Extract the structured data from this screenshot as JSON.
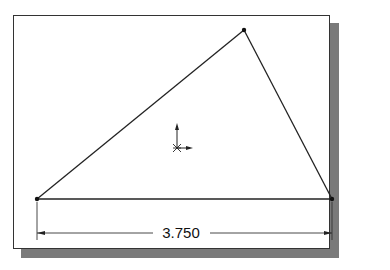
{
  "sketch": {
    "dimension": {
      "label": "3.750",
      "orientation": "horizontal"
    },
    "vertices": [
      {
        "name": "bottom-left",
        "x": 37,
        "y": 199
      },
      {
        "name": "apex",
        "x": 244,
        "y": 30
      },
      {
        "name": "bottom-right",
        "x": 332,
        "y": 199
      }
    ],
    "origin": {
      "x": 177,
      "y": 148
    },
    "colors": {
      "line": "#222222",
      "shadow": "#7a7a7a",
      "background": "#ffffff"
    }
  }
}
